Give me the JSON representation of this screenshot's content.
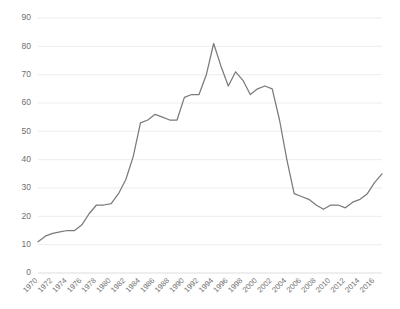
{
  "chart_data": {
    "type": "line",
    "title": "",
    "subtitle": "",
    "xlabel": "",
    "ylabel": "",
    "grid": true,
    "grid_axis": "y",
    "legend": false,
    "legend_position": "none",
    "line_color": "#7a7a7a",
    "grid_color": "#e8e8e8",
    "axis_color": "#d9d9d9",
    "tick_label_color": "#6f6f6f",
    "ylim": [
      0,
      90
    ],
    "yticks": [
      0,
      10,
      20,
      30,
      40,
      50,
      60,
      70,
      80,
      90
    ],
    "ytick_labels": [
      "0",
      "10",
      "20",
      "30",
      "40",
      "50",
      "60",
      "70",
      "80",
      "90"
    ],
    "xlim": [
      1970,
      2017
    ],
    "xticks": [
      1970,
      1972,
      1974,
      1976,
      1978,
      1980,
      1982,
      1984,
      1986,
      1988,
      1990,
      1992,
      1994,
      1996,
      1998,
      2000,
      2002,
      2004,
      2006,
      2008,
      2010,
      2012,
      2014,
      2016
    ],
    "xtick_labels": [
      "1970",
      "1972",
      "1974",
      "1976",
      "1978",
      "1980",
      "1982",
      "1984",
      "1986",
      "1988",
      "1990",
      "1992",
      "1994",
      "1996",
      "1998",
      "2000",
      "2002",
      "2004",
      "2006",
      "2008",
      "2010",
      "2012",
      "2014",
      "2016"
    ],
    "xtick_rotation": -45,
    "x": [
      1970,
      1971,
      1972,
      1973,
      1974,
      1975,
      1976,
      1977,
      1978,
      1979,
      1980,
      1981,
      1982,
      1983,
      1984,
      1985,
      1986,
      1987,
      1988,
      1989,
      1990,
      1991,
      1992,
      1993,
      1994,
      1995,
      1996,
      1997,
      1998,
      1999,
      2000,
      2001,
      2002,
      2003,
      2004,
      2005,
      2006,
      2007,
      2008,
      2009,
      2010,
      2011,
      2012,
      2013,
      2014,
      2015,
      2016,
      2017
    ],
    "values": [
      11,
      13,
      14,
      14.5,
      15,
      15,
      17,
      21,
      24,
      24,
      24.5,
      28,
      33,
      41,
      53,
      54,
      56,
      55,
      54,
      54,
      62,
      63,
      63,
      70,
      81,
      73,
      66,
      71,
      68,
      63,
      65,
      66,
      65,
      54,
      40,
      28,
      27,
      26,
      24,
      22.5,
      24,
      24,
      23,
      25,
      26,
      28,
      32,
      35
    ],
    "series": [
      {
        "name": "series-1",
        "color": "#7a7a7a",
        "values": [
          11,
          13,
          14,
          14.5,
          15,
          15,
          17,
          21,
          24,
          24,
          24.5,
          28,
          33,
          41,
          53,
          54,
          56,
          55,
          54,
          54,
          62,
          63,
          63,
          70,
          81,
          73,
          66,
          71,
          68,
          63,
          65,
          66,
          65,
          54,
          40,
          28,
          27,
          26,
          24,
          22.5,
          24,
          24,
          23,
          25,
          26,
          28,
          32,
          35
        ]
      }
    ],
    "annotations": []
  },
  "layout": {
    "plot_left": 38,
    "plot_right": 382,
    "plot_top": 18,
    "plot_bottom": 273
  }
}
